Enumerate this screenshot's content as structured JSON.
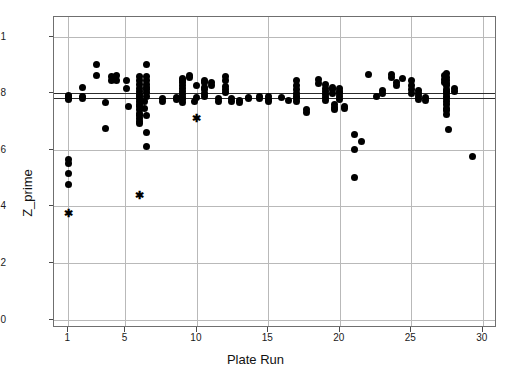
{
  "chart_data": {
    "type": "scatter",
    "title": "",
    "xlabel": "Plate Run",
    "ylabel": "Z_prime",
    "xlim": [
      0,
      31
    ],
    "ylim": [
      -0.03,
      1.07
    ],
    "grid": true,
    "legend": null,
    "xticks": [
      1,
      5,
      10,
      15,
      20,
      25,
      30
    ],
    "xtick_labels": [
      "1",
      "5",
      "10",
      "15",
      "20",
      "25",
      "30"
    ],
    "yticks": [
      0,
      0.2,
      0.4,
      0.6,
      0.8,
      1
    ],
    "ytick_labels": [
      "0",
      "0.2",
      "0.4",
      "0.6",
      "0.8",
      "1"
    ],
    "reference_lines": [
      {
        "name": "upper-control-line",
        "y": 0.802,
        "color": "#2b2b2b"
      },
      {
        "name": "center-line",
        "y": 0.785,
        "color": "#2b2b2b"
      }
    ],
    "series": [
      {
        "name": "Z_prime values",
        "marker": "circle",
        "color": "#000000",
        "points": [
          [
            1,
            0.793
          ],
          [
            1,
            0.788
          ],
          [
            1,
            0.783
          ],
          [
            1,
            0.778
          ],
          [
            1,
            0.565
          ],
          [
            1,
            0.552
          ],
          [
            1,
            0.515
          ],
          [
            1,
            0.478
          ],
          [
            2,
            0.822
          ],
          [
            2,
            0.79
          ],
          [
            2,
            0.783
          ],
          [
            3,
            0.902
          ],
          [
            3,
            0.862
          ],
          [
            3.6,
            0.766
          ],
          [
            3.6,
            0.675
          ],
          [
            4,
            0.858
          ],
          [
            4,
            0.845
          ],
          [
            4.35,
            0.862
          ],
          [
            4.35,
            0.845
          ],
          [
            5.1,
            0.845
          ],
          [
            5.1,
            0.818
          ],
          [
            5.2,
            0.752
          ],
          [
            6,
            0.86
          ],
          [
            6,
            0.845
          ],
          [
            6,
            0.832
          ],
          [
            6,
            0.818
          ],
          [
            6,
            0.806
          ],
          [
            6,
            0.795
          ],
          [
            6,
            0.788
          ],
          [
            6,
            0.78
          ],
          [
            6,
            0.772
          ],
          [
            6,
            0.762
          ],
          [
            6,
            0.752
          ],
          [
            6,
            0.742
          ],
          [
            6,
            0.73
          ],
          [
            6,
            0.722
          ],
          [
            6,
            0.712
          ],
          [
            6,
            0.7
          ],
          [
            6,
            0.692
          ],
          [
            6.3,
            0.772
          ],
          [
            6.3,
            0.745
          ],
          [
            6.5,
            0.902
          ],
          [
            6.5,
            0.858
          ],
          [
            6.5,
            0.845
          ],
          [
            6.5,
            0.832
          ],
          [
            6.5,
            0.822
          ],
          [
            6.5,
            0.812
          ],
          [
            6.5,
            0.802
          ],
          [
            6.5,
            0.788
          ],
          [
            6.5,
            0.722
          ],
          [
            6.5,
            0.66
          ],
          [
            6.5,
            0.612
          ],
          [
            7.6,
            0.782
          ],
          [
            7.6,
            0.772
          ],
          [
            8.6,
            0.786
          ],
          [
            8.6,
            0.778
          ],
          [
            9,
            0.852
          ],
          [
            9,
            0.845
          ],
          [
            9,
            0.838
          ],
          [
            9,
            0.828
          ],
          [
            9,
            0.818
          ],
          [
            9,
            0.805
          ],
          [
            9,
            0.795
          ],
          [
            9,
            0.786
          ],
          [
            9,
            0.778
          ],
          [
            9,
            0.768
          ],
          [
            9.5,
            0.862
          ],
          [
            9.5,
            0.855
          ],
          [
            9.8,
            0.772
          ],
          [
            10,
            0.828
          ],
          [
            10,
            0.786
          ],
          [
            10.5,
            0.845
          ],
          [
            10.5,
            0.838
          ],
          [
            10.5,
            0.82
          ],
          [
            10.5,
            0.812
          ],
          [
            10.5,
            0.8
          ],
          [
            10.5,
            0.79
          ],
          [
            11,
            0.838
          ],
          [
            11,
            0.826
          ],
          [
            11.5,
            0.782
          ],
          [
            11.5,
            0.772
          ],
          [
            12,
            0.858
          ],
          [
            12,
            0.845
          ],
          [
            12,
            0.825
          ],
          [
            12,
            0.812
          ],
          [
            12,
            0.802
          ],
          [
            12.4,
            0.782
          ],
          [
            12.4,
            0.772
          ],
          [
            13,
            0.775
          ],
          [
            13,
            0.766
          ],
          [
            13.6,
            0.786
          ],
          [
            13.6,
            0.78
          ],
          [
            14.4,
            0.79
          ],
          [
            14.4,
            0.782
          ],
          [
            15,
            0.788
          ],
          [
            15,
            0.778
          ],
          [
            15,
            0.77
          ],
          [
            15.9,
            0.786
          ],
          [
            16.4,
            0.775
          ],
          [
            17,
            0.845
          ],
          [
            17,
            0.826
          ],
          [
            17,
            0.812
          ],
          [
            17,
            0.8
          ],
          [
            17,
            0.79
          ],
          [
            17,
            0.78
          ],
          [
            17,
            0.77
          ],
          [
            17.7,
            0.742
          ],
          [
            17.7,
            0.732
          ],
          [
            18.5,
            0.848
          ],
          [
            18.5,
            0.835
          ],
          [
            19,
            0.83
          ],
          [
            19,
            0.818
          ],
          [
            19,
            0.806
          ],
          [
            19,
            0.795
          ],
          [
            19,
            0.785
          ],
          [
            19,
            0.775
          ],
          [
            19.5,
            0.822
          ],
          [
            19.5,
            0.812
          ],
          [
            19.5,
            0.8
          ],
          [
            19.6,
            0.76
          ],
          [
            19.6,
            0.75
          ],
          [
            19.6,
            0.742
          ],
          [
            20,
            0.818
          ],
          [
            20,
            0.806
          ],
          [
            20,
            0.798
          ],
          [
            20,
            0.788
          ],
          [
            20,
            0.778
          ],
          [
            20.3,
            0.755
          ],
          [
            20.3,
            0.745
          ],
          [
            21,
            0.655
          ],
          [
            21,
            0.6
          ],
          [
            21,
            0.502
          ],
          [
            21.5,
            0.628
          ],
          [
            22,
            0.866
          ],
          [
            22.6,
            0.79
          ],
          [
            23,
            0.81
          ],
          [
            23,
            0.8
          ],
          [
            23.6,
            0.868
          ],
          [
            23.6,
            0.855
          ],
          [
            24,
            0.838
          ],
          [
            24,
            0.826
          ],
          [
            24.4,
            0.852
          ],
          [
            25,
            0.845
          ],
          [
            25,
            0.826
          ],
          [
            25,
            0.812
          ],
          [
            25,
            0.8
          ],
          [
            25.5,
            0.81
          ],
          [
            25.5,
            0.798
          ],
          [
            25.5,
            0.788
          ],
          [
            25.5,
            0.778
          ],
          [
            26,
            0.786
          ],
          [
            26,
            0.775
          ],
          [
            27.3,
            0.862
          ],
          [
            27.3,
            0.85
          ],
          [
            27.3,
            0.84
          ],
          [
            27.5,
            0.87
          ],
          [
            27.5,
            0.856
          ],
          [
            27.5,
            0.846
          ],
          [
            27.5,
            0.836
          ],
          [
            27.5,
            0.826
          ],
          [
            27.5,
            0.815
          ],
          [
            27.5,
            0.806
          ],
          [
            27.5,
            0.798
          ],
          [
            27.5,
            0.79
          ],
          [
            27.5,
            0.782
          ],
          [
            27.5,
            0.772
          ],
          [
            27.5,
            0.76
          ],
          [
            27.5,
            0.748
          ],
          [
            27.5,
            0.738
          ],
          [
            27.5,
            0.725
          ],
          [
            27.6,
            0.672
          ],
          [
            28,
            0.818
          ],
          [
            28,
            0.806
          ],
          [
            29.3,
            0.575
          ]
        ]
      },
      {
        "name": "flagged outliers",
        "marker": "asterisk",
        "color": "#000000",
        "points": [
          [
            1,
            0.375
          ],
          [
            6,
            0.44
          ],
          [
            10,
            0.712
          ]
        ]
      }
    ]
  },
  "axes": {
    "x_title": "Plate Run",
    "y_title": "Z_prime"
  }
}
